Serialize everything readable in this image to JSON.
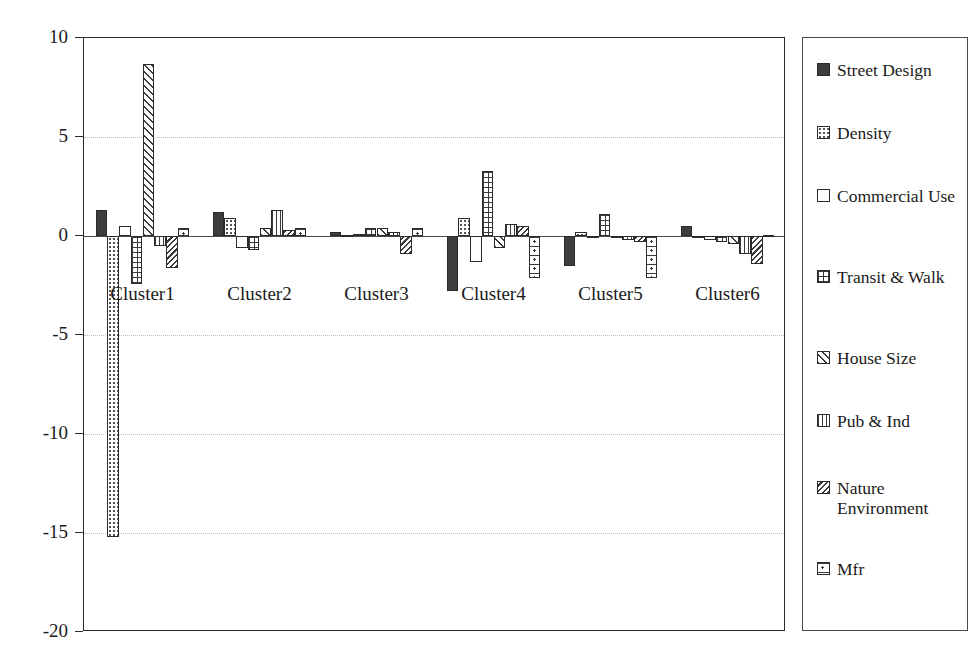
{
  "chart_data": {
    "type": "bar",
    "title": "",
    "xlabel": "",
    "ylabel": "",
    "ylim": [
      -20,
      10
    ],
    "yticks": [
      10,
      5,
      0,
      -5,
      -10,
      -15,
      -20
    ],
    "ytick_labels": [
      "10",
      "5",
      "0",
      "-5",
      "-10",
      "-15",
      "-20"
    ],
    "grid": true,
    "legend_position": "right",
    "categories": [
      "Cluster1",
      "Cluster2",
      "Cluster3",
      "Cluster4",
      "Cluster5",
      "Cluster6"
    ],
    "series": [
      {
        "name": "Street Design",
        "pattern": "solid",
        "values": [
          1.3,
          1.2,
          0.2,
          -2.8,
          -1.5,
          0.5
        ]
      },
      {
        "name": "Density",
        "pattern": "dots",
        "values": [
          -15.2,
          0.9,
          0.05,
          0.9,
          0.2,
          -0.1
        ]
      },
      {
        "name": "Commercial Use",
        "pattern": "empty",
        "values": [
          0.5,
          -0.6,
          0.1,
          -1.3,
          -0.1,
          -0.2
        ]
      },
      {
        "name": "Transit & Walk",
        "pattern": "grid",
        "values": [
          -2.4,
          -0.7,
          0.4,
          3.3,
          1.1,
          -0.3
        ]
      },
      {
        "name": "House Size",
        "pattern": "diag",
        "values": [
          8.7,
          0.4,
          0.4,
          -0.6,
          -0.1,
          -0.4
        ]
      },
      {
        "name": "Pub & Ind",
        "pattern": "vert",
        "values": [
          -0.5,
          1.3,
          0.2,
          0.6,
          -0.2,
          -0.9
        ]
      },
      {
        "name": "Nature Environment",
        "pattern": "backdiag",
        "values": [
          -1.6,
          0.3,
          -0.9,
          0.5,
          -0.3,
          -1.4
        ]
      },
      {
        "name": "Mfr",
        "pattern": "boxdot",
        "values": [
          0.4,
          0.4,
          0.4,
          -2.1,
          -2.1,
          0.05
        ]
      }
    ]
  },
  "legend": {
    "items": [
      {
        "label": "Street Design",
        "pattern": "solid"
      },
      {
        "label": "Density",
        "pattern": "dots"
      },
      {
        "label": "Commercial Use",
        "pattern": "empty"
      },
      {
        "label": "Transit & Walk",
        "pattern": "grid"
      },
      {
        "label": "House Size",
        "pattern": "diag"
      },
      {
        "label": "Pub & Ind",
        "pattern": "vert"
      },
      {
        "label": "Nature Environment",
        "pattern": "backdiag"
      },
      {
        "label": "Mfr",
        "pattern": "boxdot"
      }
    ]
  }
}
